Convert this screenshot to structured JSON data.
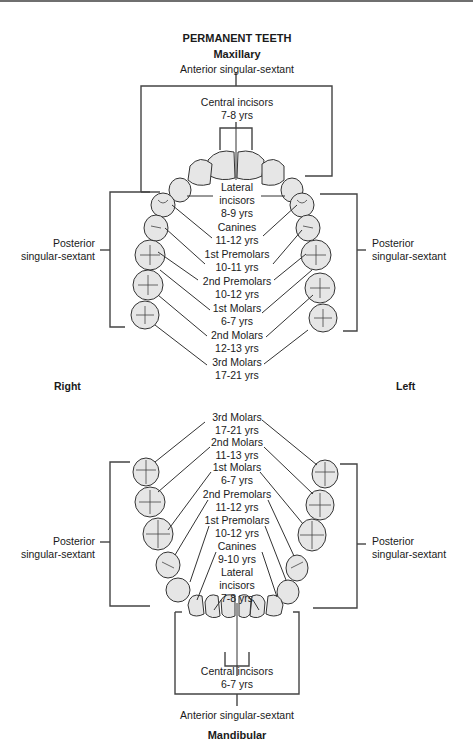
{
  "title": "PERMANENT TEETH",
  "maxillary": {
    "heading": "Maxillary",
    "anterior_label": "Anterior singular-sextant",
    "posterior_left_label": [
      "Posterior",
      "singular-sextant"
    ],
    "posterior_right_label": [
      "Posterior",
      "singular-sextant"
    ],
    "teeth": [
      {
        "name": "Central incisors",
        "age": "7-8 yrs"
      },
      {
        "name": "Lateral incisors",
        "name_lines": [
          "Lateral",
          "incisors"
        ],
        "age": "8-9 yrs"
      },
      {
        "name": "Canines",
        "age": "11-12 yrs"
      },
      {
        "name": "1st Premolars",
        "age": "10-11 yrs"
      },
      {
        "name": "2nd Premolars",
        "age": "10-12 yrs"
      },
      {
        "name": "1st Molars",
        "age": "6-7 yrs"
      },
      {
        "name": "2nd Molars",
        "age": "12-13 yrs"
      },
      {
        "name": "3rd Molars",
        "age": "17-21 yrs"
      }
    ]
  },
  "sides": {
    "right": "Right",
    "left": "Left"
  },
  "mandibular": {
    "heading": "Mandibular",
    "anterior_label": "Anterior singular-sextant",
    "posterior_left_label": [
      "Posterior",
      "singular-sextant"
    ],
    "posterior_right_label": [
      "Posterior",
      "singular-sextant"
    ],
    "teeth": [
      {
        "name": "3rd Molars",
        "age": "17-21 yrs"
      },
      {
        "name": "2nd Molars",
        "age": "11-13 yrs"
      },
      {
        "name": "1st Molars",
        "age": "6-7 yrs"
      },
      {
        "name": "2nd Premolars",
        "age": "11-12 yrs"
      },
      {
        "name": "1st Premolars",
        "age": "10-12 yrs"
      },
      {
        "name": "Canines",
        "age": "9-10 yrs"
      },
      {
        "name": "Lateral incisors",
        "name_lines": [
          "Lateral",
          "incisors"
        ],
        "age": "7-8 yrs"
      },
      {
        "name": "Central incisors",
        "age": "6-7 yrs"
      }
    ]
  },
  "colors": {
    "tooth_fill": "#e6e6e6",
    "stroke": "#333333",
    "text": "#1a1a1a"
  }
}
